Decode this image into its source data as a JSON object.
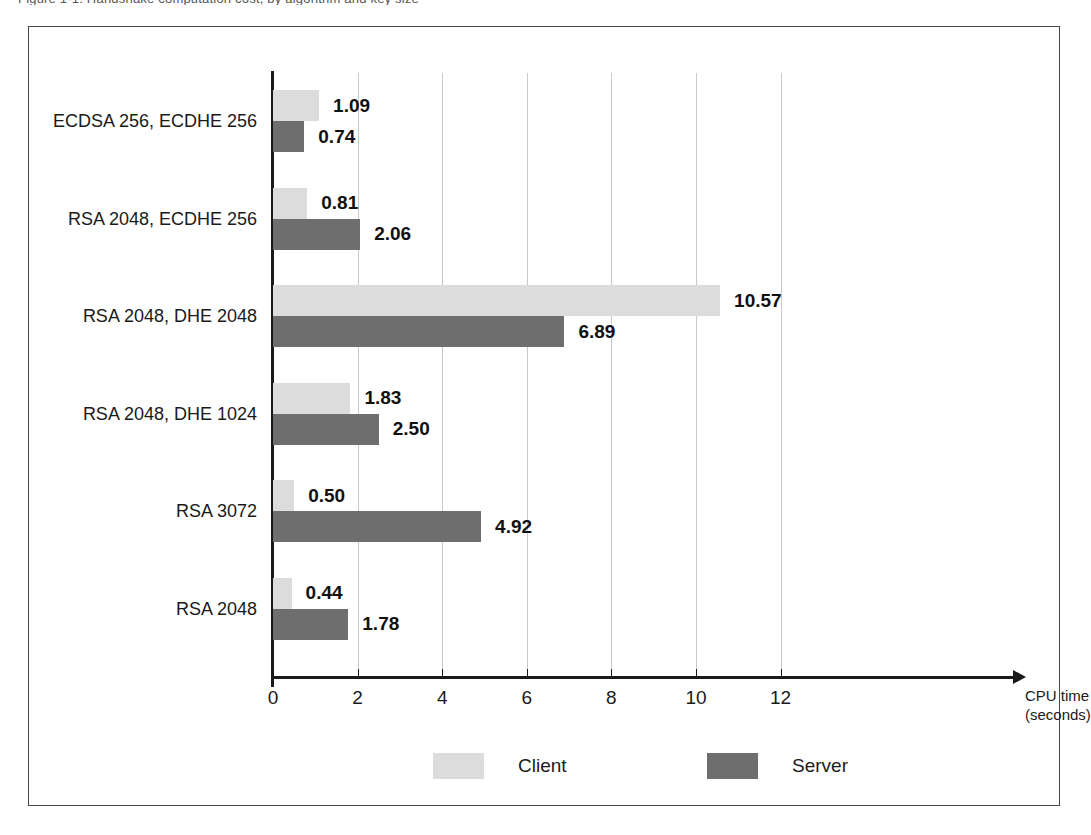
{
  "caption_sliver": "Figure 1-1. Handshake computation cost, by algorithm and key size",
  "chart_data": {
    "type": "bar",
    "orientation": "horizontal",
    "grouped": true,
    "title": "",
    "subtitle": "",
    "xlabel": "CPU time",
    "xlabel_unit": "(seconds)",
    "ylabel": "",
    "xlim": [
      0,
      13.2
    ],
    "xticks": [
      0,
      2,
      4,
      6,
      8,
      10,
      12
    ],
    "xtick_labels": [
      "0",
      "2",
      "4",
      "6",
      "8",
      "10",
      "12"
    ],
    "grid": "vertical",
    "legend_position": "bottom",
    "categories": [
      "ECDSA 256, ECDHE 256",
      "RSA 2048, ECDHE 256",
      "RSA 2048, DHE 2048",
      "RSA 2048, DHE 1024",
      "RSA 3072",
      "RSA 2048"
    ],
    "series": [
      {
        "name": "Client",
        "color": "#dcdcdc",
        "values": [
          1.09,
          0.81,
          10.57,
          1.83,
          0.5,
          0.44
        ],
        "labels": [
          "1.09",
          "0.81",
          "10.57",
          "1.83",
          "0.50",
          "0.44"
        ]
      },
      {
        "name": "Server",
        "color": "#6e6e6e",
        "values": [
          0.74,
          2.06,
          6.89,
          2.5,
          4.92,
          1.78
        ],
        "labels": [
          "0.74",
          "2.06",
          "6.89",
          "2.50",
          "4.92",
          "1.78"
        ]
      }
    ]
  },
  "legend": {
    "items": [
      {
        "label": "Client",
        "color": "#dcdcdc"
      },
      {
        "label": "Server",
        "color": "#6e6e6e"
      }
    ]
  },
  "colors": {
    "client": "#dcdcdc",
    "server": "#6e6e6e",
    "axis": "#1a1a1a",
    "grid": "#c9c9c9",
    "frame": "#4a4a4a",
    "background": "#ffffff"
  }
}
